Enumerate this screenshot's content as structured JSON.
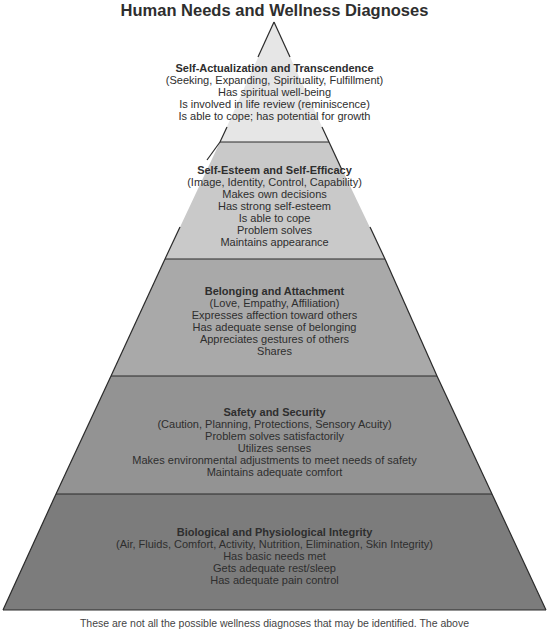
{
  "title": "Human Needs and Wellness Diagnoses",
  "colors": {
    "tier1": "#e6e6e6",
    "tier2": "#c9c9c9",
    "tier3": "#a9a9a9",
    "tier4": "#939393",
    "tier5": "#7c7c7c",
    "outline": "#2a2a2a"
  },
  "tiers": [
    {
      "heading": "Self-Actualization and Transcendence",
      "subtitle": "(Seeking, Expanding, Spirituality, Fulfillment)",
      "items": [
        "Has spiritual well-being",
        "Is involved in life review (reminiscence)",
        "Is able to cope; has potential for growth"
      ]
    },
    {
      "heading": "Self-Esteem and Self-Efficacy",
      "subtitle": "(Image, Identity, Control, Capability)",
      "items": [
        "Makes own decisions",
        "Has strong self-esteem",
        "Is able to cope",
        "Problem solves",
        "Maintains appearance"
      ]
    },
    {
      "heading": "Belonging and Attachment",
      "subtitle": "(Love, Empathy, Affiliation)",
      "items": [
        "Expresses affection toward others",
        "Has adequate sense of belonging",
        "Appreciates gestures of others",
        "Shares"
      ]
    },
    {
      "heading": "Safety and Security",
      "subtitle": "(Caution, Planning, Protections, Sensory Acuity)",
      "items": [
        "Problem solves satisfactorily",
        "Utilizes senses",
        "Makes environmental adjustments to meet needs of safety",
        "Maintains adequate comfort"
      ]
    },
    {
      "heading": "Biological and Physiological Integrity",
      "subtitle": "(Air, Fluids, Comfort, Activity, Nutrition, Elimination, Skin Integrity)",
      "items": [
        "Has basic needs met",
        "Gets adequate rest/sleep",
        "Has adequate pain control"
      ]
    }
  ],
  "footnote": "These are not all the possible wellness diagnoses that may be identified. The above"
}
